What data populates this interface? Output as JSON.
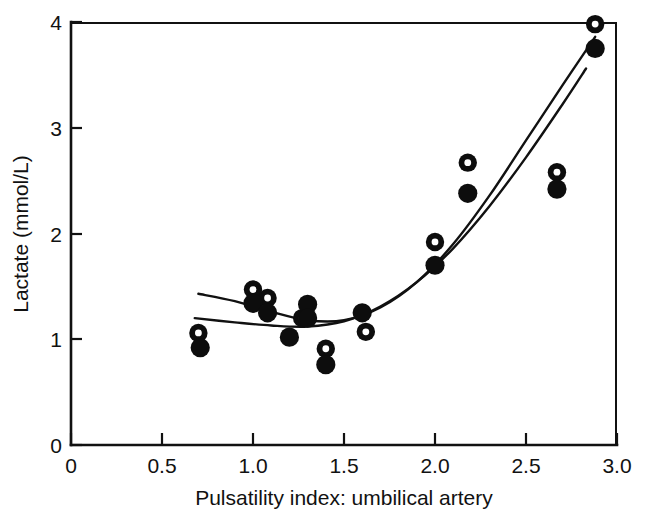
{
  "figure": {
    "name": "lactate-vs-pulsatility-index-scatter",
    "background_color": "#ffffff",
    "ink_color": "#111111"
  },
  "chart_data": {
    "type": "scatter",
    "title": "",
    "subtitle": "",
    "xlabel": "Pulsatility index: umbilical artery",
    "ylabel": "Lactate (mmol/L)",
    "xlim": [
      0,
      3.0
    ],
    "ylim": [
      0,
      4
    ],
    "xticks": [
      0,
      0.5,
      1.0,
      1.5,
      2.0,
      2.5,
      3.0
    ],
    "xticklabels": [
      "0",
      "0.5",
      "1.0",
      "1.5",
      "2.0",
      "2.5",
      "3.0"
    ],
    "yticks": [
      0,
      1,
      2,
      3,
      4
    ],
    "yticklabels": [
      "0",
      "1",
      "2",
      "3",
      "4"
    ],
    "grid": false,
    "legend": "none",
    "legend_position": "none",
    "marker_styles": {
      "open_circle": "open circle (white fill, black ring)",
      "filled_circle": "solid black circle"
    },
    "series": [
      {
        "name": "open-circle",
        "marker": "open_circle",
        "x": [
          0.7,
          1.0,
          1.08,
          1.27,
          1.4,
          1.62,
          2.0,
          2.18,
          2.67,
          2.88
        ],
        "y": [
          1.06,
          1.47,
          1.39,
          1.2,
          0.91,
          1.07,
          1.92,
          2.67,
          2.58,
          3.98
        ]
      },
      {
        "name": "filled-circle",
        "marker": "filled_circle",
        "x": [
          0.71,
          1.0,
          1.08,
          1.2,
          1.3,
          1.3,
          1.4,
          1.6,
          2.0,
          2.18,
          2.67,
          2.88
        ],
        "y": [
          0.92,
          1.34,
          1.25,
          1.02,
          1.33,
          1.2,
          0.76,
          1.25,
          1.7,
          2.38,
          2.42,
          3.75
        ]
      }
    ],
    "fitted_curves": [
      {
        "name": "upper-fitted-curve",
        "style": "solid",
        "points": [
          [
            0.7,
            1.43
          ],
          [
            0.9,
            1.36
          ],
          [
            1.1,
            1.26
          ],
          [
            1.3,
            1.18
          ],
          [
            1.5,
            1.18
          ],
          [
            1.7,
            1.3
          ],
          [
            1.9,
            1.54
          ],
          [
            2.1,
            1.9
          ],
          [
            2.3,
            2.36
          ],
          [
            2.5,
            2.88
          ],
          [
            2.7,
            3.4
          ],
          [
            2.88,
            3.86
          ]
        ]
      },
      {
        "name": "lower-fitted-curve",
        "style": "solid",
        "points": [
          [
            0.68,
            1.2
          ],
          [
            0.9,
            1.16
          ],
          [
            1.1,
            1.13
          ],
          [
            1.3,
            1.12
          ],
          [
            1.5,
            1.17
          ],
          [
            1.7,
            1.31
          ],
          [
            1.9,
            1.54
          ],
          [
            2.1,
            1.86
          ],
          [
            2.3,
            2.26
          ],
          [
            2.5,
            2.72
          ],
          [
            2.7,
            3.22
          ],
          [
            2.83,
            3.56
          ]
        ]
      }
    ],
    "n_pairs": 12
  },
  "axes": {
    "x_title": "Pulsatility index: umbilical artery",
    "y_title": "Lactate (mmol/L)",
    "x_tick_labels": [
      "0",
      "0.5",
      "1.0",
      "1.5",
      "2.0",
      "2.5",
      "3.0"
    ],
    "y_tick_labels": [
      "0",
      "1",
      "2",
      "3",
      "4"
    ]
  }
}
